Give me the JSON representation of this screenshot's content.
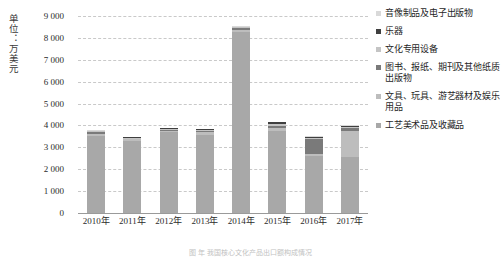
{
  "axis": {
    "unit_label": "单位：万美元",
    "y_ticks": [
      "9 000",
      "8 000",
      "7 000",
      "6 000",
      "5 000",
      "4 000",
      "3 000",
      "2 000",
      "1 000",
      "0"
    ],
    "x_ticks": [
      "2010年",
      "2011年",
      "2012年",
      "2013年",
      "2014年",
      "2015年",
      "2016年",
      "2017年"
    ]
  },
  "caption": {
    "text": "图     年 我国核心文化产品出口额构成情况"
  },
  "legend": {
    "items": [
      {
        "label": "音像制品及电子出版物",
        "color": "#d9d9d9",
        "swatch": "legend-swatch-audio-video"
      },
      {
        "label": "乐器",
        "color": "#3f3f3f",
        "swatch": "legend-swatch-instruments"
      },
      {
        "label": "文化专用设备",
        "color": "#c4c4c4",
        "swatch": "legend-swatch-equipment"
      },
      {
        "label": "图书、报纸、期刊及其他纸质出版物",
        "color": "#7a7a7a",
        "swatch": "legend-swatch-publications"
      },
      {
        "label": "文具、玩具、游艺器材及娱乐用品",
        "color": "#bdbdbd",
        "swatch": "legend-swatch-stationery-toys"
      },
      {
        "label": "工艺美术品及收藏品",
        "color": "#a8a8a8",
        "swatch": "legend-swatch-handicrafts"
      }
    ]
  },
  "chart_data": {
    "type": "bar",
    "stacked": true,
    "title": "",
    "xlabel": "",
    "ylabel": "单位：万美元",
    "ylim": [
      0,
      9000
    ],
    "ytick_step": 1000,
    "grid": true,
    "legend_position": "right",
    "categories": [
      "2010年",
      "2011年",
      "2012年",
      "2013年",
      "2014年",
      "2015年",
      "2016年",
      "2017年"
    ],
    "series": [
      {
        "name": "工艺美术品及收藏品",
        "color": "#a8a8a8",
        "values": [
          3540,
          3300,
          3680,
          3570,
          8280,
          3730,
          2620,
          2560
        ]
      },
      {
        "name": "文具、玩具、游艺器材及娱乐用品",
        "color": "#bdbdbd",
        "values": [
          90,
          60,
          70,
          120,
          90,
          150,
          80,
          1200
        ]
      },
      {
        "name": "图书、报纸、期刊及其他纸质出版物",
        "color": "#7a7a7a",
        "values": [
          60,
          40,
          50,
          60,
          60,
          110,
          700,
          130
        ]
      },
      {
        "name": "文化专用设备",
        "color": "#c4c4c4",
        "values": [
          40,
          30,
          40,
          40,
          50,
          60,
          50,
          60
        ]
      },
      {
        "name": "乐器",
        "color": "#3f3f3f",
        "values": [
          30,
          30,
          30,
          30,
          40,
          90,
          40,
          40
        ]
      },
      {
        "name": "音像制品及电子出版物",
        "color": "#d9d9d9",
        "values": [
          20,
          20,
          30,
          20,
          40,
          40,
          30,
          30
        ]
      }
    ],
    "totals": [
      3780,
      3480,
      3900,
      3840,
      8560,
      4180,
      3520,
      4020
    ]
  }
}
